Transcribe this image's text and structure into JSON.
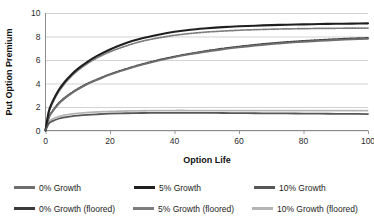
{
  "chart_data": {
    "type": "line",
    "title": "",
    "xlabel": "Option Life",
    "ylabel": "Put Option Premium",
    "xlim": [
      0,
      100
    ],
    "ylim": [
      0,
      10
    ],
    "xticks": [
      0,
      20,
      40,
      60,
      80,
      100
    ],
    "yticks": [
      0,
      2,
      4,
      6,
      8,
      10
    ],
    "grid": "horizontal",
    "legend_position": "bottom",
    "x": [
      0,
      1,
      2,
      4,
      6,
      8,
      10,
      13,
      16,
      20,
      25,
      30,
      35,
      40,
      45,
      50,
      55,
      60,
      65,
      70,
      75,
      80,
      85,
      90,
      95,
      100
    ],
    "series": [
      {
        "name": "0% Growth",
        "color": "#6e6e6e",
        "width": 1.9,
        "values": [
          0.0,
          1.05,
          1.55,
          2.25,
          2.75,
          3.15,
          3.5,
          3.95,
          4.3,
          4.75,
          5.2,
          5.6,
          5.95,
          6.25,
          6.5,
          6.72,
          6.92,
          7.08,
          7.22,
          7.35,
          7.46,
          7.55,
          7.63,
          7.7,
          7.76,
          7.8
        ]
      },
      {
        "name": "5% Growth",
        "color": "#1f1f1f",
        "width": 2.1,
        "values": [
          0.0,
          1.6,
          2.35,
          3.4,
          4.15,
          4.75,
          5.25,
          5.85,
          6.35,
          6.9,
          7.45,
          7.85,
          8.15,
          8.4,
          8.58,
          8.7,
          8.8,
          8.87,
          8.92,
          8.97,
          9.0,
          9.03,
          9.06,
          9.08,
          9.1,
          9.12
        ]
      },
      {
        "name": "10% Growth",
        "color": "#575757",
        "width": 1.8,
        "values": [
          0.0,
          0.58,
          0.78,
          1.0,
          1.12,
          1.2,
          1.26,
          1.33,
          1.38,
          1.43,
          1.47,
          1.49,
          1.5,
          1.5,
          1.5,
          1.5,
          1.49,
          1.48,
          1.47,
          1.46,
          1.45,
          1.44,
          1.43,
          1.42,
          1.41,
          1.4
        ]
      },
      {
        "name": "0% Growth (floored)",
        "color": "#3a3a3a",
        "width": 1.7,
        "dash": "1.6 1.4",
        "values": [
          0.05,
          1.1,
          1.6,
          2.3,
          2.8,
          3.2,
          3.55,
          4.0,
          4.35,
          4.8,
          5.25,
          5.65,
          6.0,
          6.3,
          6.55,
          6.78,
          6.98,
          7.15,
          7.3,
          7.43,
          7.54,
          7.63,
          7.71,
          7.78,
          7.84,
          7.88
        ]
      },
      {
        "name": "5% Growth (floored)",
        "color": "#7d7d7d",
        "width": 1.7,
        "dash": "1.6 1.4",
        "values": [
          0.05,
          1.5,
          2.22,
          3.25,
          4.0,
          4.6,
          5.1,
          5.7,
          6.18,
          6.7,
          7.2,
          7.6,
          7.88,
          8.1,
          8.26,
          8.38,
          8.46,
          8.53,
          8.58,
          8.62,
          8.65,
          8.67,
          8.69,
          8.7,
          8.71,
          8.72
        ]
      },
      {
        "name": "10% Growth (floored)",
        "color": "#b4b4b4",
        "width": 1.8,
        "dash": "1.6 1.4",
        "values": [
          0.1,
          0.72,
          0.95,
          1.18,
          1.31,
          1.4,
          1.46,
          1.53,
          1.58,
          1.62,
          1.66,
          1.68,
          1.69,
          1.7,
          1.7,
          1.7,
          1.7,
          1.7,
          1.7,
          1.7,
          1.7,
          1.7,
          1.7,
          1.7,
          1.7,
          1.7
        ]
      }
    ]
  },
  "axes": {
    "ylabel": "Put Option Premium",
    "xlabel": "Option Life",
    "yticks": [
      "10",
      "8",
      "6",
      "4",
      "2",
      "0"
    ],
    "xticks": [
      "0",
      "20",
      "40",
      "60",
      "80",
      "100"
    ]
  },
  "legend": {
    "row1": [
      {
        "label": "0% Growth",
        "color": "#6e6e6e"
      },
      {
        "label": "5% Growth",
        "color": "#1f1f1f"
      },
      {
        "label": "10% Growth",
        "color": "#575757"
      }
    ],
    "row2": [
      {
        "label": "0% Growth (floored)",
        "color": "#3a3a3a"
      },
      {
        "label": "5% Growth (floored)",
        "color": "#7d7d7d"
      },
      {
        "label": "10% Growth (floored)",
        "color": "#b4b4b4"
      }
    ]
  },
  "colors": {
    "grid": "#c8c8c8",
    "axis": "#8c8c8c",
    "text": "#1c1c1c",
    "background": "#ffffff"
  }
}
